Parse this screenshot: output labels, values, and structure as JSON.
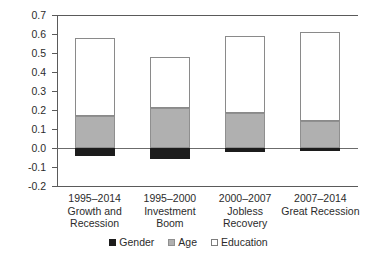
{
  "chart_data": {
    "type": "bar",
    "stacked": true,
    "title": "",
    "xlabel": "",
    "ylabel": "",
    "ylim": [
      -0.2,
      0.7
    ],
    "ytick_labels": [
      "0.7",
      "0.6",
      "0.5",
      "0.4",
      "0.3",
      "0.2",
      "0.1",
      "0.0",
      "-0.1",
      "-0.2"
    ],
    "ytick_values": [
      0.7,
      0.6,
      0.5,
      0.4,
      0.3,
      0.2,
      0.1,
      0.0,
      -0.1,
      -0.2
    ],
    "grid": false,
    "zero_line": true,
    "legend_position": "bottom",
    "categories": [
      {
        "period": "1995–2014",
        "line2": "Growth and",
        "line3": "Recession"
      },
      {
        "period": "1995–2000",
        "line2": "Investment",
        "line3": "Boom"
      },
      {
        "period": "2000–2007",
        "line2": "Jobless",
        "line3": "Recovery"
      },
      {
        "period": "2007–2014",
        "line2": "Great Recession",
        "line3": ""
      }
    ],
    "series": [
      {
        "name": "Gender",
        "color": "#1c1c1c",
        "values": [
          -0.04,
          -0.06,
          -0.02,
          -0.015
        ]
      },
      {
        "name": "Age",
        "color": "#b0b0b0",
        "values": [
          0.17,
          0.21,
          0.185,
          0.14
        ]
      },
      {
        "name": "Education",
        "color": "#ffffff",
        "values": [
          0.41,
          0.27,
          0.405,
          0.47
        ]
      }
    ],
    "bar_totals_positive": [
      0.58,
      0.48,
      0.59,
      0.61
    ],
    "legend": [
      {
        "label": "Gender",
        "color": "#1c1c1c"
      },
      {
        "label": "Age",
        "color": "#b0b0b0"
      },
      {
        "label": "Education",
        "color": "#ffffff"
      }
    ]
  }
}
